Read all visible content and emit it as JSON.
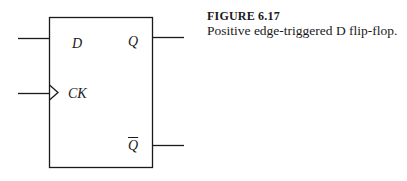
{
  "figure": {
    "number": "FIGURE  6.17",
    "caption": "Positive edge-triggered D flip-flop."
  },
  "flipflop": {
    "inputs": [
      {
        "label": "D",
        "name": "d-input"
      },
      {
        "label": "CK",
        "name": "clock-input",
        "edge_triggered": true
      }
    ],
    "outputs": [
      {
        "label": "Q",
        "name": "q-output"
      },
      {
        "label": "Q",
        "name": "q-bar-output",
        "complement": true
      }
    ]
  },
  "colors": {
    "stroke": "#1a1a1a",
    "background": "#ffffff"
  }
}
